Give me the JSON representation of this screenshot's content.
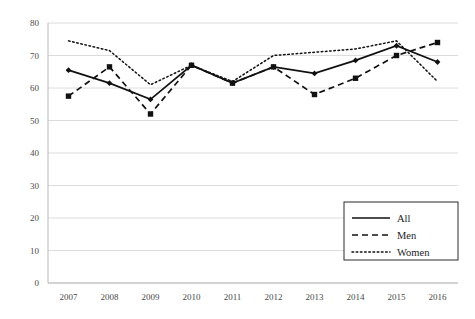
{
  "chart_data": {
    "type": "line",
    "title": "",
    "subtitle": "",
    "xlabel": "",
    "ylabel": "",
    "categories": [
      "2007",
      "2008",
      "2009",
      "2010",
      "2011",
      "2012",
      "2013",
      "2014",
      "2015",
      "2016"
    ],
    "series": [
      {
        "name": "All",
        "style": "solid",
        "marker": "diamond",
        "values": [
          65.5,
          61.5,
          56.5,
          67.0,
          61.5,
          66.5,
          64.5,
          68.5,
          73.0,
          68.0
        ]
      },
      {
        "name": "Men",
        "style": "dashed",
        "marker": "square",
        "values": [
          57.5,
          66.5,
          52.0,
          67.0,
          61.5,
          66.5,
          58.0,
          63.0,
          70.0,
          74.0
        ]
      },
      {
        "name": "Women",
        "style": "dotted",
        "marker": "none",
        "values": [
          74.5,
          71.5,
          61.0,
          67.0,
          62.0,
          70.0,
          71.0,
          72.0,
          74.5,
          62.0
        ]
      }
    ],
    "ylim": [
      0,
      80
    ],
    "ytick_values": [
      0,
      10,
      20,
      30,
      40,
      50,
      60,
      70,
      80
    ],
    "ytick_labels": [
      "0",
      "10",
      "20",
      "30",
      "40",
      "50",
      "60",
      "70",
      "80"
    ],
    "xtick_labels": [
      "2007",
      "2008",
      "2009",
      "2010",
      "2011",
      "2012",
      "2013",
      "2014",
      "2015",
      "2016"
    ],
    "grid": {
      "horizontal": true,
      "vertical": false,
      "color": "#dcdcdc"
    },
    "legend": {
      "position": "bottom-right",
      "entries": [
        {
          "label": "All",
          "style": "solid"
        },
        {
          "label": "Men",
          "style": "dashed"
        },
        {
          "label": "Women",
          "style": "dotted"
        }
      ]
    },
    "colors": {
      "line": "#111111",
      "grid": "#dcdcdc",
      "axis": "#b9b9b9",
      "text": "#4a4a4a",
      "background": "#ffffff"
    }
  }
}
